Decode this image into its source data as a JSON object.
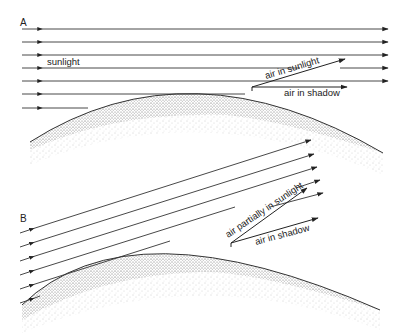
{
  "panels": {
    "A": {
      "label": "A",
      "sunlight_label": "sunlight",
      "air_sunlit_label": "air in sunlight",
      "air_shadow_label": "air in shadow"
    },
    "B": {
      "label": "B",
      "air_partial_label": "air partially in sunlight",
      "air_shadow_label": "air in shadow"
    }
  },
  "colors": {
    "line": "#333333",
    "stipple": "#555555",
    "background": "#ffffff"
  }
}
